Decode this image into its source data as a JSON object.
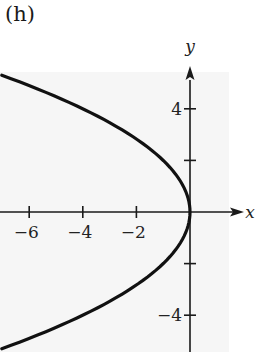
{
  "figure": {
    "panel_label": "(h)",
    "x_axis_label": "x",
    "y_axis_label": "y",
    "x_ticks": [
      {
        "value": -6,
        "label": "−6"
      },
      {
        "value": -4,
        "label": "−4"
      },
      {
        "value": -2,
        "label": "−2"
      }
    ],
    "y_ticks": [
      {
        "value": 4,
        "label": "4"
      },
      {
        "value": 2,
        "label": ""
      },
      {
        "value": -2,
        "label": ""
      },
      {
        "value": -4,
        "label": "−4"
      }
    ],
    "curve": {
      "equation": "y^2 = -4x",
      "description": "Parabola opening left, vertex at origin",
      "y_range": [
        -5.3,
        5.3
      ]
    },
    "colors": {
      "curve": "#111111",
      "axes": "#1a1a1a",
      "plot_background": "#f6f6f6"
    }
  }
}
